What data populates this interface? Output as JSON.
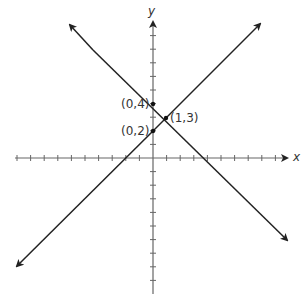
{
  "problem_number": "",
  "chart_data": {
    "type": "line",
    "title": "",
    "xlabel": "x",
    "ylabel": "y",
    "grid": false,
    "xlim": [
      -10,
      10
    ],
    "ylim": [
      -10,
      9.5
    ],
    "series": [
      {
        "name": "y = -x + 4",
        "slope": -1,
        "intercept": 4,
        "x": [
          -6,
          10
        ],
        "y": [
          10,
          -6
        ]
      },
      {
        "name": "y = x + 2",
        "slope": 1,
        "intercept": 2,
        "x": [
          -10,
          8
        ],
        "y": [
          -8,
          10
        ]
      }
    ],
    "points": [
      {
        "label": "(0,4)",
        "x": 0,
        "y": 4
      },
      {
        "label": "(0,2)",
        "x": 0,
        "y": 2
      },
      {
        "label": "(1,3)",
        "x": 1,
        "y": 3
      }
    ],
    "annotations": [
      "(0,4)",
      "(0,2)",
      "(1,3)"
    ]
  },
  "labels": {
    "x_axis": "x",
    "y_axis": "y",
    "p04": "(0,4)",
    "p02": "(0,2)",
    "p13": "(1,3)"
  },
  "colors": {
    "axis": "#555555",
    "line": "#222222",
    "point": "#111111"
  }
}
